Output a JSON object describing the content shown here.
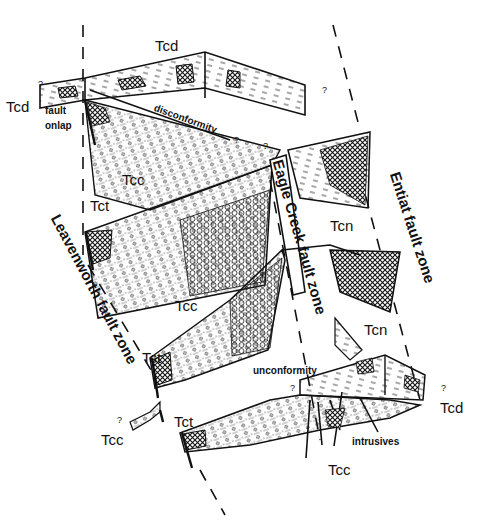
{
  "diagram": {
    "style": "black-and-white geologic cross-section sketch",
    "colors": {
      "ink": "#111111",
      "background": "#ffffff"
    },
    "fault_zones": [
      {
        "id": "leavenworth",
        "label": "Leavenworth fault zone"
      },
      {
        "id": "eagle-creek",
        "label": "Eagle Creek fault zone"
      },
      {
        "id": "entiat",
        "label": "Entiat fault zone"
      }
    ],
    "units": {
      "tcd_top": "Tcd",
      "tcd_left": "Tcd",
      "tcc_upper": "Tcc",
      "tct_upper": "Tct",
      "tcc_middle": "Tcc",
      "tcn_upper": "Tcn",
      "tcn_lower": "Tcn",
      "tct_middle": "Tct",
      "tct_lower": "Tct",
      "tcc_lower_left": "Tcc",
      "tcc_bottom": "Tcc",
      "tcd_right": "Tcd"
    },
    "annotations": {
      "fault_onlap_1": "fault",
      "fault_onlap_2": "onlap",
      "disconformity": "disconformity",
      "unconformity": "unconformity",
      "intrusives": "intrusives",
      "uncertain": "?"
    }
  }
}
